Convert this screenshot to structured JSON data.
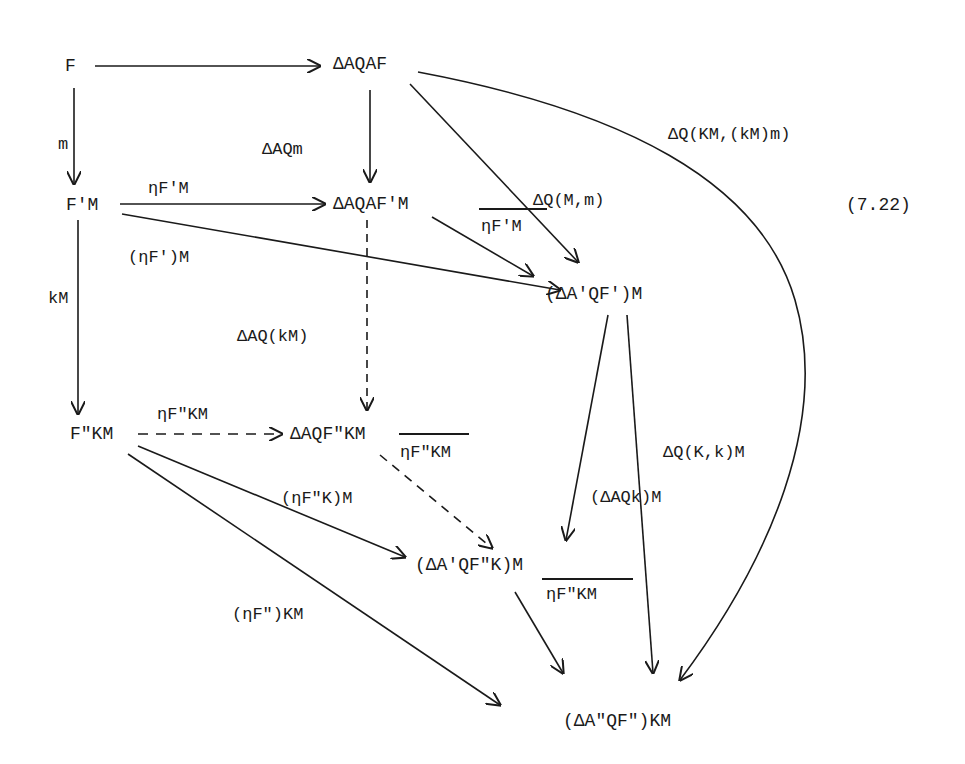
{
  "equation_number": "(7.22)",
  "nodes": {
    "F": "F",
    "DAQAF": "ΔAQAF",
    "FpM": "F'M",
    "DAQAFpM": "ΔAQAF'M",
    "DApQFpM": "(ΔA'QF')M",
    "FppKM": "F\"KM",
    "DAQFppKM": "ΔAQF\"KM",
    "DApQFppKM": "(ΔA'QF\"K)M",
    "DAppQFppKM": "(ΔA\"QF\")KM"
  },
  "edges": {
    "top": "",
    "m": "m",
    "DAQm": "ΔAQm",
    "eta_FpM": "ηF'M",
    "eta_Fp_M_paren": "(ηF')M",
    "eta_Fp_M_bar": "ηF'M",
    "DQ_M_m": "ΔQ(M,m)",
    "DQ_KM_kMm": "ΔQ(KM,(kM)m)",
    "kM": "kM",
    "DAQ_kM": "ΔAQ(kM)",
    "eta_FppKM": "ηF\"KM",
    "eta_FppK_M_bar": "ηF\"KM",
    "eta_FppK_M_paren": "(ηF\"K)M",
    "DAQk_M": "(ΔAQk)M",
    "DQ_Kk_M": "ΔQ(K,k)M",
    "eta_Fpp_KM_bar": "ηF\"KM",
    "eta_Fpp_KM_paren": "(ηF\")KM"
  }
}
